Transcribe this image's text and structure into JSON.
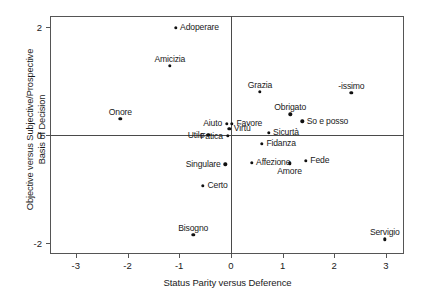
{
  "chart_data": {
    "type": "scatter",
    "title": "",
    "xlabel": "Status Parity versus Deference",
    "ylabel": "Objective versus Subjective/Prospective\nBasis of Decision",
    "xlim": [
      -3.5,
      3.35
    ],
    "ylim": [
      -2.2,
      2.2
    ],
    "xticks": [
      -3,
      -2,
      -1,
      0,
      1,
      2,
      3
    ],
    "xticklabels": [
      "-3",
      "-2",
      "-1",
      "0",
      "1",
      "2",
      "3"
    ],
    "yticks": [
      2,
      0,
      -2
    ],
    "yticklabels": [
      "2",
      "0",
      "-2"
    ],
    "grid": false,
    "legend": null,
    "reference_lines": {
      "x": 0,
      "y": 0
    },
    "points": [
      {
        "label": "Adoperare",
        "x": -1.07,
        "y": 1.98,
        "label_pos": "right"
      },
      {
        "label": "Amicizia",
        "x": -1.18,
        "y": 1.28,
        "label_pos": "above"
      },
      {
        "label": "Grazia",
        "x": 0.56,
        "y": 0.8,
        "label_pos": "above"
      },
      {
        "label": "-issimo",
        "x": 2.33,
        "y": 0.78,
        "label_pos": "above"
      },
      {
        "label": "Onore",
        "x": -2.14,
        "y": 0.3,
        "label_pos": "above"
      },
      {
        "label": "Obrigato",
        "x": 1.15,
        "y": 0.38,
        "label_pos": "above"
      },
      {
        "label": "So e posso",
        "x": 1.38,
        "y": 0.25,
        "label_pos": "right"
      },
      {
        "label": "Aiuto",
        "x": -0.08,
        "y": 0.21,
        "label_pos": "left"
      },
      {
        "label": "Favore",
        "x": 0.02,
        "y": 0.21,
        "label_pos": "right"
      },
      {
        "label": "Virtù",
        "x": -0.03,
        "y": 0.12,
        "label_pos": "right"
      },
      {
        "label": "Sicurtà",
        "x": 0.73,
        "y": 0.04,
        "label_pos": "right"
      },
      {
        "label": "Utile",
        "x": -0.44,
        "y": 0.0,
        "label_pos": "left"
      },
      {
        "label": "Fatica",
        "x": -0.06,
        "y": -0.02,
        "label_pos": "left"
      },
      {
        "label": "Fidanza",
        "x": 0.6,
        "y": -0.16,
        "label_pos": "right"
      },
      {
        "label": "Affezione",
        "x": 0.4,
        "y": -0.51,
        "label_pos": "right"
      },
      {
        "label": "Singulare",
        "x": -0.11,
        "y": -0.54,
        "label_pos": "left"
      },
      {
        "label": "Amore",
        "x": 1.14,
        "y": -0.52,
        "label_pos": "below"
      },
      {
        "label": "Fede",
        "x": 1.45,
        "y": -0.48,
        "label_pos": "right"
      },
      {
        "label": "Certo",
        "x": -0.54,
        "y": -0.94,
        "label_pos": "right"
      },
      {
        "label": "Bisogno",
        "x": -0.73,
        "y": -1.85,
        "label_pos": "above"
      },
      {
        "label": "Servigio",
        "x": 2.98,
        "y": -1.93,
        "label_pos": "above"
      }
    ]
  }
}
